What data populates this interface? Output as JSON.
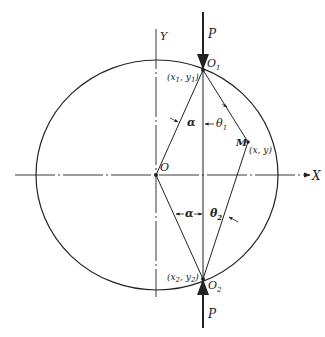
{
  "diagram": {
    "axes": {
      "x_label": "X",
      "y_label": "Y"
    },
    "origin_label": "O",
    "force_label_top": "P",
    "force_label_bottom": "P",
    "points": {
      "o1": {
        "name": "O",
        "sub": "1",
        "coord_x": "x",
        "coord_x_sub": "1",
        "coord_y": "y",
        "coord_y_sub": "1"
      },
      "o2": {
        "name": "O",
        "sub": "2",
        "coord_x": "x",
        "coord_x_sub": "2",
        "coord_y": "y",
        "coord_y_sub": "2"
      },
      "m": {
        "name": "M",
        "coords": "(x, y)"
      }
    },
    "angles": {
      "alpha_top": "α",
      "alpha_bottom": "α",
      "theta1": "θ",
      "theta1_sub": "1",
      "theta2": "θ",
      "theta2_sub": "2"
    },
    "colors": {
      "ink": "#222222",
      "background": "#ffffff"
    }
  }
}
